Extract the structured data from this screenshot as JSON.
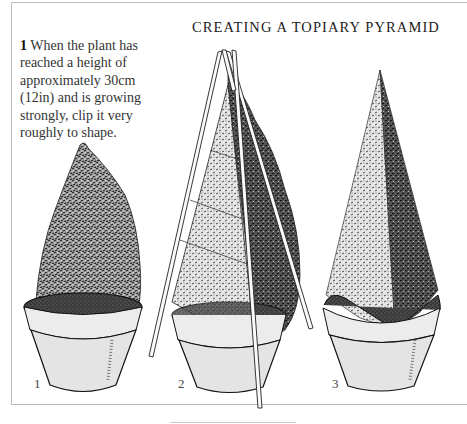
{
  "document": {
    "title": "CREATING A TOPIARY PYRAMID",
    "caption": {
      "step_number": "1",
      "text": "When the plant has reached a height of approximately 30cm (12in) and is growing strongly, clip it very roughly to shape."
    },
    "figures": [
      {
        "label": "1",
        "description": "roughly clipped conifer in pot"
      },
      {
        "label": "2",
        "description": "plant with bamboo cane pyramid frame being clipped"
      },
      {
        "label": "3",
        "description": "finished topiary pyramid in pot"
      }
    ]
  },
  "colors": {
    "ink": "#1a1a1a",
    "pot_fill": "#e4e4e4",
    "frame_line": "#bdbdbd"
  }
}
